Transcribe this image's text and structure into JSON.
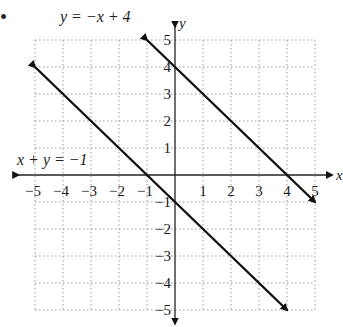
{
  "chart_data": {
    "type": "line",
    "title": "",
    "xlabel": "x",
    "ylabel": "y",
    "xlim": [
      -5,
      5
    ],
    "ylim": [
      -5,
      5
    ],
    "grid": true,
    "x_ticks": [
      "-5",
      "-4",
      "-3",
      "-2",
      "-1",
      "1",
      "2",
      "3",
      "4",
      "5"
    ],
    "y_ticks": [
      "5",
      "4",
      "3",
      "2",
      "1",
      "-1",
      "-2",
      "-3",
      "-4",
      "-5"
    ],
    "series": [
      {
        "name": "y = −x + 4",
        "equation": "y = -x + 4",
        "start": [
          -1,
          5
        ],
        "end": [
          5,
          -1
        ]
      },
      {
        "name": "x + y = −1",
        "equation": "x + y = -1",
        "start": [
          -5,
          4
        ],
        "end": [
          4,
          -5
        ]
      }
    ],
    "annotations": [
      {
        "text": "y = −x + 4",
        "near": [
          -1,
          5
        ]
      },
      {
        "text": "x + y = −1",
        "near": [
          -4,
          0.5
        ]
      }
    ]
  },
  "marker": "•"
}
